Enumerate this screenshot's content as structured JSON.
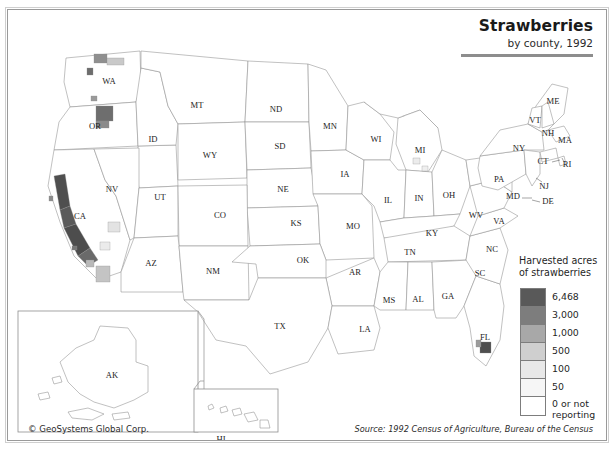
{
  "title": {
    "main": "Strawberries",
    "subtitle": "by county, 1992"
  },
  "legend": {
    "heading": "Harvested acres of strawberries",
    "breaks": [
      {
        "label": "6,468",
        "color": "#595959"
      },
      {
        "label": "3,000",
        "color": "#7d7d7d"
      },
      {
        "label": "1,000",
        "color": "#a8a8a8"
      },
      {
        "label": "500",
        "color": "#cfcfcf"
      },
      {
        "label": "100",
        "color": "#e8e8e8"
      },
      {
        "label": "50",
        "color": "#f6f6f6"
      },
      {
        "label": "0 or not reporting",
        "color": "#ffffff"
      }
    ]
  },
  "footer": {
    "copyright": "© GeoSystems Global Corp.",
    "source": "Source:  1992 Census of Agriculture, Bureau of the Census"
  },
  "states": [
    {
      "code": "WA",
      "x": 101,
      "y": 72
    },
    {
      "code": "OR",
      "x": 87,
      "y": 117
    },
    {
      "code": "ID",
      "x": 145,
      "y": 130
    },
    {
      "code": "MT",
      "x": 189,
      "y": 96
    },
    {
      "code": "WY",
      "x": 202,
      "y": 146
    },
    {
      "code": "ND",
      "x": 268,
      "y": 100
    },
    {
      "code": "SD",
      "x": 272,
      "y": 137
    },
    {
      "code": "NE",
      "x": 275,
      "y": 180
    },
    {
      "code": "MN",
      "x": 322,
      "y": 117
    },
    {
      "code": "IA",
      "x": 337,
      "y": 165
    },
    {
      "code": "NV",
      "x": 104,
      "y": 180
    },
    {
      "code": "UT",
      "x": 152,
      "y": 188
    },
    {
      "code": "CO",
      "x": 212,
      "y": 206
    },
    {
      "code": "KS",
      "x": 288,
      "y": 214
    },
    {
      "code": "MO",
      "x": 345,
      "y": 217
    },
    {
      "code": "CA",
      "x": 72,
      "y": 207
    },
    {
      "code": "AZ",
      "x": 143,
      "y": 254
    },
    {
      "code": "NM",
      "x": 205,
      "y": 262
    },
    {
      "code": "OK",
      "x": 295,
      "y": 251
    },
    {
      "code": "AR",
      "x": 347,
      "y": 263
    },
    {
      "code": "TX",
      "x": 272,
      "y": 317
    },
    {
      "code": "LA",
      "x": 357,
      "y": 320
    },
    {
      "code": "MS",
      "x": 381,
      "y": 291
    },
    {
      "code": "AL",
      "x": 410,
      "y": 290
    },
    {
      "code": "TN",
      "x": 402,
      "y": 243
    },
    {
      "code": "KY",
      "x": 424,
      "y": 224
    },
    {
      "code": "GA",
      "x": 440,
      "y": 287
    },
    {
      "code": "FL",
      "x": 477,
      "y": 328
    },
    {
      "code": "SC",
      "x": 472,
      "y": 264
    },
    {
      "code": "NC",
      "x": 484,
      "y": 240
    },
    {
      "code": "VA",
      "x": 491,
      "y": 212
    },
    {
      "code": "WV",
      "x": 468,
      "y": 206
    },
    {
      "code": "OH",
      "x": 441,
      "y": 186
    },
    {
      "code": "IN",
      "x": 411,
      "y": 189
    },
    {
      "code": "IL",
      "x": 380,
      "y": 191
    },
    {
      "code": "WI",
      "x": 368,
      "y": 130
    },
    {
      "code": "MI",
      "x": 412,
      "y": 141
    },
    {
      "code": "PA",
      "x": 491,
      "y": 170
    },
    {
      "code": "NY",
      "x": 511,
      "y": 139
    },
    {
      "code": "ME",
      "x": 545,
      "y": 92
    },
    {
      "code": "VT",
      "x": 527,
      "y": 111
    },
    {
      "code": "NH",
      "x": 540,
      "y": 124
    },
    {
      "code": "MA",
      "x": 557,
      "y": 131
    },
    {
      "code": "CT",
      "x": 535,
      "y": 152
    },
    {
      "code": "RI",
      "x": 559,
      "y": 155
    },
    {
      "code": "NJ",
      "x": 536,
      "y": 177
    },
    {
      "code": "MD",
      "x": 505,
      "y": 187
    },
    {
      "code": "DE",
      "x": 540,
      "y": 192
    },
    {
      "code": "AK",
      "x": 104,
      "y": 366
    },
    {
      "code": "HI",
      "x": 213,
      "y": 430
    }
  ]
}
